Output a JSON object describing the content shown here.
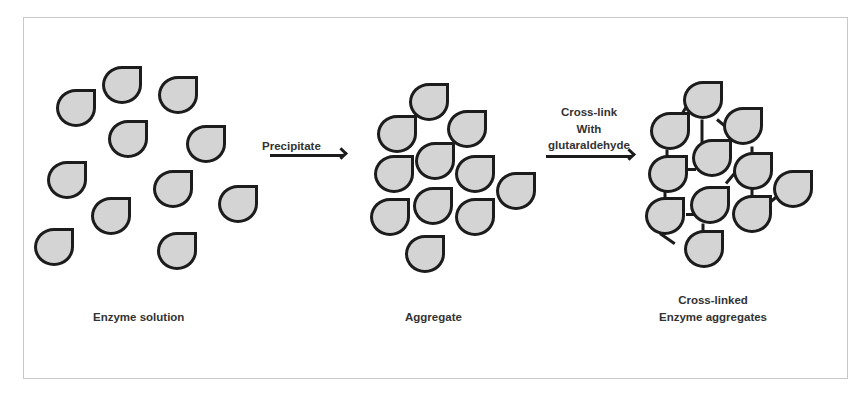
{
  "diagram": {
    "stages": [
      {
        "id": "enzyme-solution",
        "label": "Enzyme solution"
      },
      {
        "id": "aggregate",
        "label": "Aggregate"
      },
      {
        "id": "cross-linked",
        "label_line1": "Cross-linked",
        "label_line2": "Enzyme aggregates"
      }
    ],
    "arrows": [
      {
        "id": "precipitate",
        "label": "Precipitate"
      },
      {
        "id": "cross-link",
        "label_line1": "Cross-link",
        "label_line2": "With",
        "label_line3": "glutaraldehyde"
      }
    ],
    "colors": {
      "drop_fill": "#d4d4d4",
      "drop_outline": "#1c1c1c",
      "frame": "#c8c8c8",
      "text": "#333333"
    },
    "enzyme_count_per_stage": 11
  }
}
